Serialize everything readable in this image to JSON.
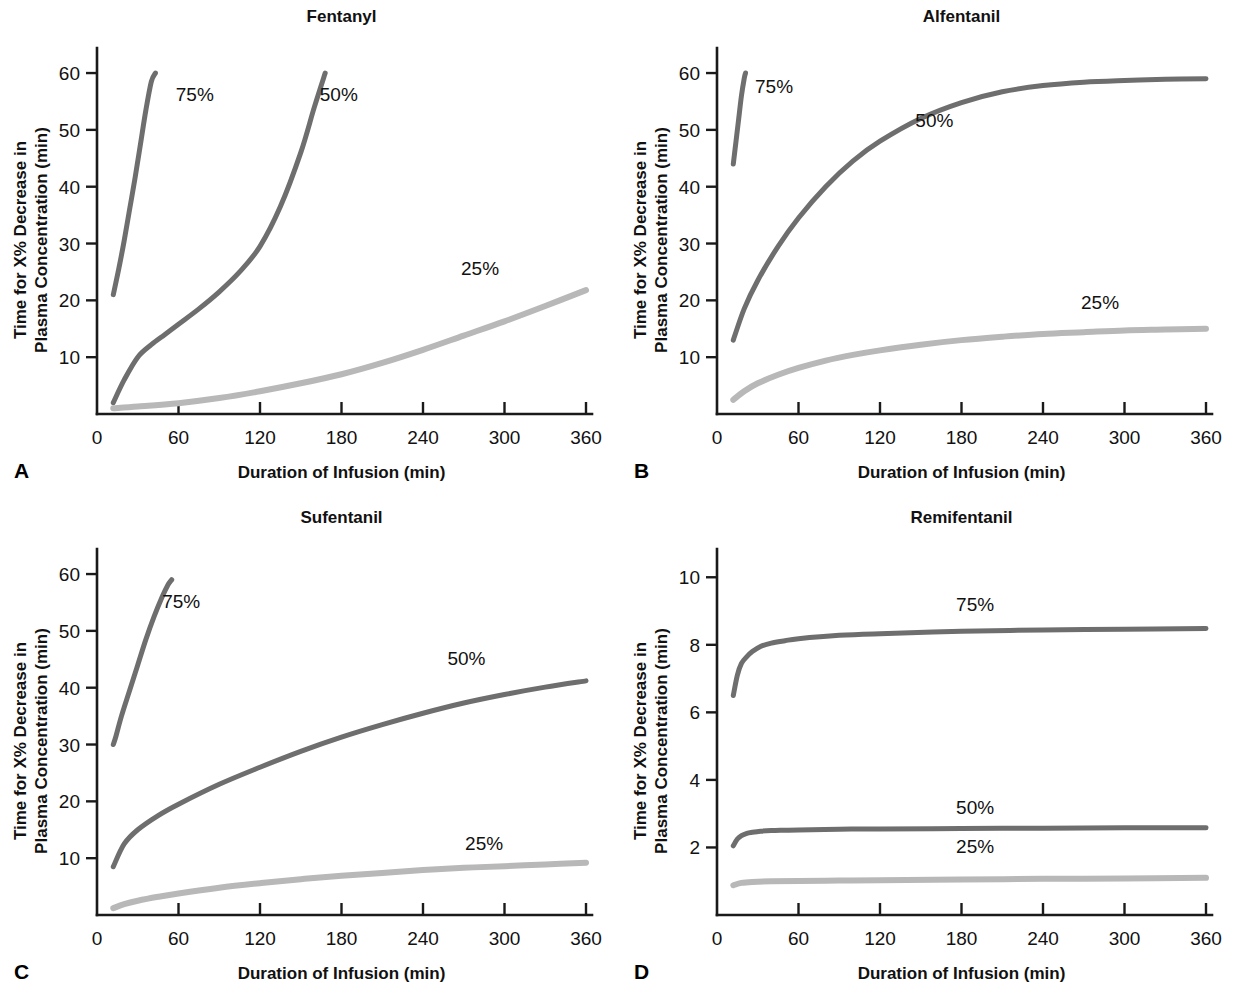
{
  "figure": {
    "background_color": "#ffffff",
    "panel_count": 4
  },
  "style": {
    "dark_curve_color": "#6e6e6e",
    "light_curve_color": "#b8b8b8",
    "axis_color": "#1a1a1a",
    "text_color": "#111111"
  },
  "common": {
    "ylabel_line1": "Time for X% Decrease in",
    "ylabel_line2": "Plasma Concentration (min)",
    "xlabel": "Duration of Infusion (min)",
    "x_ticks": [
      0,
      60,
      120,
      180,
      240,
      300,
      360
    ],
    "x_tick_labels": [
      "0",
      "60",
      "120",
      "180",
      "240",
      "300",
      "360"
    ],
    "xlim": [
      0,
      360
    ]
  },
  "panels": [
    {
      "letter": "A",
      "title": "Fentanyl",
      "y_ticks": [
        10,
        20,
        30,
        40,
        50,
        60
      ],
      "y_tick_labels": [
        "10",
        "20",
        "30",
        "40",
        "50",
        "60"
      ],
      "ylim": [
        0,
        63
      ]
    },
    {
      "letter": "B",
      "title": "Alfentanil",
      "y_ticks": [
        10,
        20,
        30,
        40,
        50,
        60
      ],
      "y_tick_labels": [
        "10",
        "20",
        "30",
        "40",
        "50",
        "60"
      ],
      "ylim": [
        0,
        63
      ]
    },
    {
      "letter": "C",
      "title": "Sufentanil",
      "y_ticks": [
        10,
        20,
        30,
        40,
        50,
        60
      ],
      "y_tick_labels": [
        "10",
        "20",
        "30",
        "40",
        "50",
        "60"
      ],
      "ylim": [
        0,
        63
      ]
    },
    {
      "letter": "D",
      "title": "Remifentanil",
      "y_ticks": [
        2,
        4,
        6,
        8,
        10
      ],
      "y_tick_labels": [
        "2",
        "4",
        "6",
        "8",
        "10"
      ],
      "ylim": [
        0,
        10.6
      ]
    }
  ],
  "chart_data": [
    {
      "type": "line",
      "panel": "A",
      "title": "Fentanyl",
      "xlabel": "Duration of Infusion (min)",
      "ylabel": "Time for X% Decrease in Plasma Concentration (min)",
      "xlim": [
        0,
        360
      ],
      "ylim": [
        0,
        63
      ],
      "grid": false,
      "legend": "inline-annotations",
      "x_ticks": [
        0,
        60,
        120,
        180,
        240,
        300,
        360
      ],
      "y_ticks": [
        10,
        20,
        30,
        40,
        50,
        60
      ],
      "series": [
        {
          "name": "75%",
          "color": "#6e6e6e",
          "label_x": 72,
          "label_y": 55,
          "x": [
            12,
            16,
            20,
            24,
            28,
            32,
            36,
            40,
            43
          ],
          "values": [
            21.0,
            25.5,
            30.5,
            36.0,
            41.5,
            47.5,
            53.5,
            58.5,
            60.0
          ]
        },
        {
          "name": "50%",
          "color": "#6e6e6e",
          "label_x": 178,
          "label_y": 55,
          "x": [
            12,
            20,
            30,
            40,
            50,
            60,
            75,
            90,
            105,
            120,
            135,
            150,
            160,
            168
          ],
          "values": [
            2.0,
            6.0,
            10.0,
            12.2,
            14.0,
            15.8,
            18.5,
            21.5,
            25.0,
            29.5,
            36.5,
            46.0,
            54.0,
            60.0
          ]
        },
        {
          "name": "25%",
          "color": "#b8b8b8",
          "label_x": 282,
          "label_y": 24.5,
          "x": [
            12,
            30,
            60,
            90,
            120,
            150,
            180,
            210,
            240,
            270,
            300,
            330,
            360
          ],
          "values": [
            1.0,
            1.3,
            1.9,
            2.8,
            4.0,
            5.4,
            7.0,
            9.0,
            11.3,
            13.8,
            16.3,
            19.0,
            21.8
          ]
        }
      ]
    },
    {
      "type": "line",
      "panel": "B",
      "title": "Alfentanil",
      "xlabel": "Duration of Infusion (min)",
      "ylabel": "Time for X% Decrease in Plasma Concentration (min)",
      "xlim": [
        0,
        360
      ],
      "ylim": [
        0,
        63
      ],
      "grid": false,
      "legend": "inline-annotations",
      "x_ticks": [
        0,
        60,
        120,
        180,
        240,
        300,
        360
      ],
      "y_ticks": [
        10,
        20,
        30,
        40,
        50,
        60
      ],
      "series": [
        {
          "name": "75%",
          "color": "#6e6e6e",
          "label_x": 42,
          "label_y": 56.5,
          "x": [
            12,
            14,
            16,
            18,
            20,
            21
          ],
          "values": [
            44.0,
            48.0,
            52.0,
            56.0,
            59.0,
            60.0
          ]
        },
        {
          "name": "50%",
          "color": "#6e6e6e",
          "label_x": 160,
          "label_y": 50.5,
          "x": [
            12,
            20,
            30,
            45,
            60,
            80,
            100,
            120,
            150,
            180,
            210,
            240,
            270,
            300,
            330,
            360
          ],
          "values": [
            13.0,
            18.5,
            23.5,
            29.5,
            34.5,
            40.0,
            44.5,
            48.0,
            52.0,
            54.8,
            56.7,
            57.8,
            58.4,
            58.7,
            58.9,
            59.0
          ]
        },
        {
          "name": "25%",
          "color": "#b8b8b8",
          "label_x": 282,
          "label_y": 18.5,
          "x": [
            12,
            20,
            30,
            45,
            60,
            80,
            100,
            120,
            150,
            180,
            210,
            240,
            270,
            300,
            330,
            360
          ],
          "values": [
            2.5,
            4.0,
            5.4,
            6.9,
            8.1,
            9.4,
            10.4,
            11.2,
            12.2,
            13.0,
            13.6,
            14.1,
            14.4,
            14.7,
            14.85,
            15.0
          ]
        }
      ]
    },
    {
      "type": "line",
      "panel": "C",
      "title": "Sufentanil",
      "xlabel": "Duration of Infusion (min)",
      "ylabel": "Time for X% Decrease in Plasma Concentration (min)",
      "xlim": [
        0,
        360
      ],
      "ylim": [
        0,
        63
      ],
      "grid": false,
      "legend": "inline-annotations",
      "x_ticks": [
        0,
        60,
        120,
        180,
        240,
        300,
        360
      ],
      "y_ticks": [
        10,
        20,
        30,
        40,
        50,
        60
      ],
      "series": [
        {
          "name": "75%",
          "color": "#6e6e6e",
          "label_x": 62,
          "label_y": 54,
          "x": [
            12,
            14,
            18,
            24,
            30,
            36,
            42,
            48,
            52,
            55
          ],
          "values": [
            30.0,
            31.5,
            35.0,
            39.5,
            44.0,
            48.5,
            52.5,
            56.0,
            58.0,
            59.0
          ]
        },
        {
          "name": "50%",
          "color": "#6e6e6e",
          "label_x": 272,
          "label_y": 44,
          "x": [
            12,
            20,
            30,
            45,
            60,
            90,
            120,
            150,
            180,
            210,
            240,
            270,
            300,
            330,
            360
          ],
          "values": [
            8.5,
            12.5,
            15.0,
            17.5,
            19.5,
            23.0,
            26.0,
            28.8,
            31.3,
            33.5,
            35.5,
            37.3,
            38.8,
            40.1,
            41.2
          ]
        },
        {
          "name": "25%",
          "color": "#b8b8b8",
          "label_x": 285,
          "label_y": 11.5,
          "x": [
            12,
            20,
            30,
            45,
            60,
            90,
            120,
            150,
            180,
            210,
            240,
            270,
            300,
            330,
            360
          ],
          "values": [
            1.2,
            1.9,
            2.5,
            3.2,
            3.8,
            4.8,
            5.6,
            6.3,
            6.9,
            7.4,
            7.9,
            8.3,
            8.6,
            8.9,
            9.2
          ]
        }
      ]
    },
    {
      "type": "line",
      "panel": "D",
      "title": "Remifentanil",
      "xlabel": "Duration of Infusion (min)",
      "ylabel": "Time for X% Decrease in Plasma Concentration (min)",
      "xlim": [
        0,
        360
      ],
      "ylim": [
        0,
        10.6
      ],
      "grid": false,
      "legend": "inline-annotations",
      "x_ticks": [
        0,
        60,
        120,
        180,
        240,
        300,
        360
      ],
      "y_ticks": [
        2,
        4,
        6,
        8,
        10
      ],
      "series": [
        {
          "name": "75%",
          "color": "#6e6e6e",
          "label_x": 190,
          "label_y": 9.0,
          "x": [
            12,
            15,
            18,
            22,
            26,
            32,
            40,
            50,
            60,
            90,
            120,
            180,
            240,
            300,
            360
          ],
          "values": [
            6.5,
            7.1,
            7.45,
            7.65,
            7.8,
            7.95,
            8.05,
            8.12,
            8.18,
            8.28,
            8.33,
            8.4,
            8.44,
            8.46,
            8.48
          ]
        },
        {
          "name": "50%",
          "color": "#6e6e6e",
          "label_x": 190,
          "label_y": 3.0,
          "x": [
            12,
            15,
            18,
            22,
            26,
            32,
            40,
            50,
            60,
            90,
            120,
            180,
            240,
            300,
            360
          ],
          "values": [
            2.05,
            2.25,
            2.35,
            2.42,
            2.45,
            2.48,
            2.5,
            2.51,
            2.52,
            2.54,
            2.55,
            2.56,
            2.57,
            2.58,
            2.58
          ]
        },
        {
          "name": "25%",
          "color": "#b8b8b8",
          "label_x": 190,
          "label_y": 1.85,
          "x": [
            12,
            18,
            26,
            40,
            60,
            90,
            120,
            180,
            240,
            300,
            360
          ],
          "values": [
            0.88,
            0.95,
            0.98,
            1.0,
            1.01,
            1.02,
            1.03,
            1.05,
            1.07,
            1.08,
            1.1
          ]
        }
      ]
    }
  ]
}
